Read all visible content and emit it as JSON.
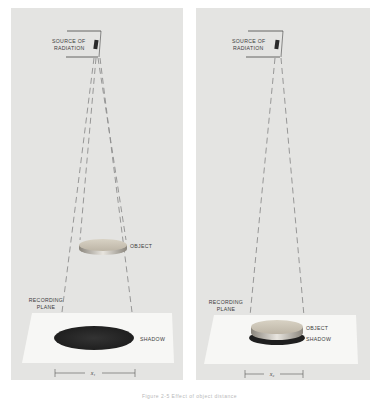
{
  "figure": {
    "panels": [
      {
        "id": "panel-1",
        "source_label_line1": "SOURCE OF",
        "source_label_line2": "RADIATION",
        "object_label": "OBJECT",
        "plane_label_line1": "RECORDING",
        "plane_label_line2": "PLANE",
        "shadow_label": "SHADOW",
        "dimension_label": "x₁",
        "description": "Object far from recording plane produces large magnified shadow"
      },
      {
        "id": "panel-2",
        "source_label_line1": "SOURCE OF",
        "source_label_line2": "RADIATION",
        "object_label": "OBJECT",
        "plane_label_line1": "RECORDING",
        "plane_label_line2": "PLANE",
        "shadow_label": "SHADOW",
        "dimension_label": "x₂",
        "description": "Object close to recording plane produces shadow nearly equal in size"
      }
    ],
    "caption": "Figure 2-5  Effect of object distance"
  },
  "colors": {
    "panel_bg": "#e4e4e2",
    "plane": "#f6f6f4",
    "shadow": "#2e2e2e",
    "object_top": "#c9c2b4",
    "dashed_line": "#8a8a8a"
  }
}
